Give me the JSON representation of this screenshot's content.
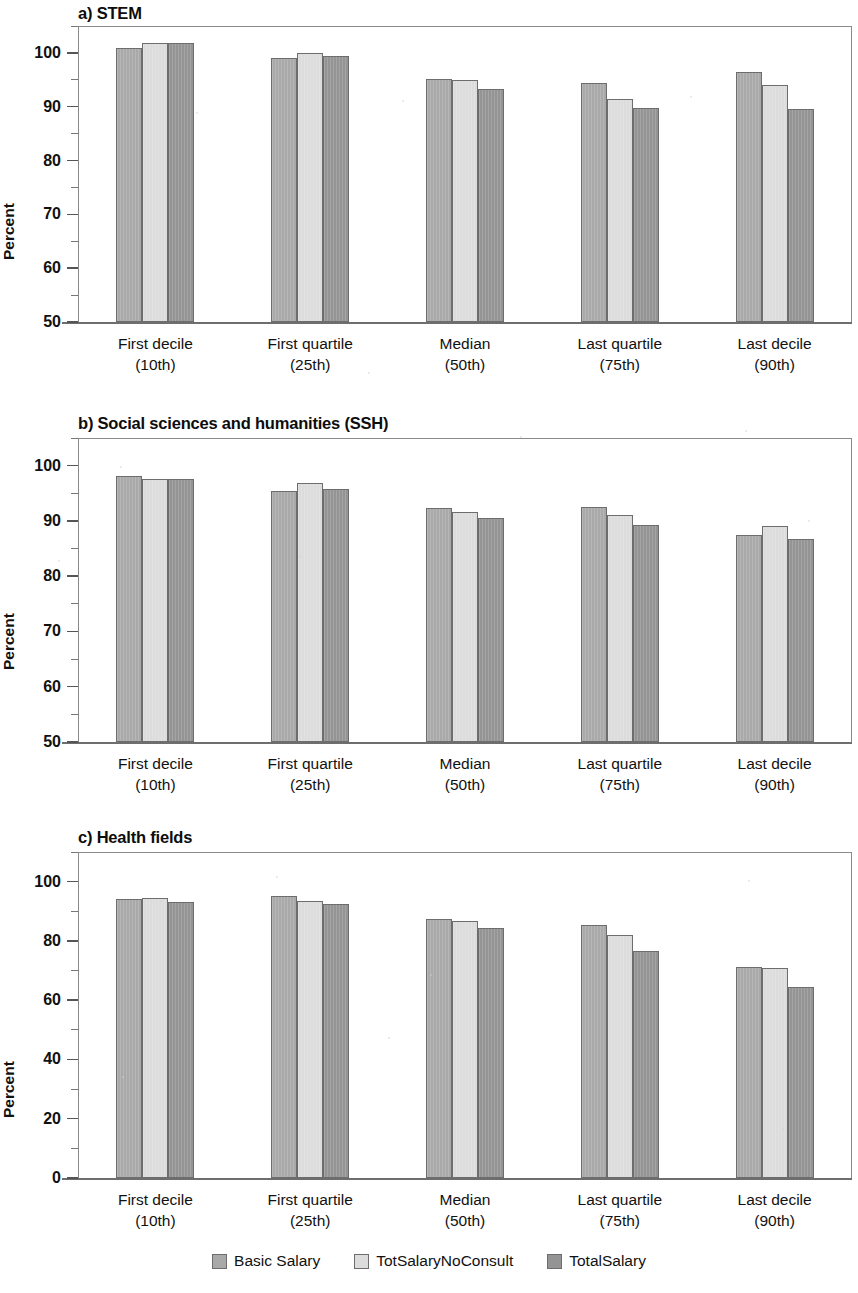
{
  "figure": {
    "ylabel": "Percent",
    "legend_position": "bottom-center",
    "series_colors": {
      "basic_salary": "#a9a9a9",
      "tot_salary_no_consult": "#dcdcdc",
      "total_salary": "#949494"
    }
  },
  "legend": {
    "items": [
      {
        "label": "Basic Salary",
        "color": "#a9a9a9"
      },
      {
        "label": "TotSalaryNoConsult",
        "color": "#dcdcdc"
      },
      {
        "label": "TotalSalary",
        "color": "#949494"
      }
    ]
  },
  "categories": [
    {
      "main": "First decile",
      "sub": "(10th)"
    },
    {
      "main": "First quartile",
      "sub": "(25th)"
    },
    {
      "main": "Median",
      "sub": "(50th)"
    },
    {
      "main": "Last quartile",
      "sub": "(75th)"
    },
    {
      "main": "Last decile",
      "sub": "(90th)"
    }
  ],
  "chart_data": [
    {
      "type": "bar",
      "panel": "a",
      "title": "a) STEM",
      "xlabel": "",
      "ylabel": "Percent",
      "ylim": [
        50,
        105
      ],
      "yticks": [
        50,
        60,
        70,
        80,
        90,
        100
      ],
      "ytick_labels": [
        "50",
        "60",
        "70",
        "80",
        "90",
        "100"
      ],
      "minor_ticks": [
        55,
        65,
        75,
        85,
        95,
        105
      ],
      "grid": false,
      "legend": "bottom",
      "categories": [
        "First decile (10th)",
        "First quartile (25th)",
        "Median (50th)",
        "Last quartile (75th)",
        "Last decile (90th)"
      ],
      "series": [
        {
          "name": "Basic Salary",
          "values": [
            101.0,
            99.1,
            95.1,
            94.4,
            96.5
          ]
        },
        {
          "name": "TotSalaryNoConsult",
          "values": [
            101.8,
            99.9,
            94.9,
            91.5,
            94.0
          ]
        },
        {
          "name": "TotalSalary",
          "values": [
            101.8,
            99.5,
            93.3,
            89.7,
            89.6
          ]
        }
      ]
    },
    {
      "type": "bar",
      "panel": "b",
      "title": "b) Social sciences and humanities (SSH)",
      "xlabel": "",
      "ylabel": "Percent",
      "ylim": [
        50,
        105
      ],
      "yticks": [
        50,
        60,
        70,
        80,
        90,
        100
      ],
      "ytick_labels": [
        "50",
        "60",
        "70",
        "80",
        "90",
        "100"
      ],
      "minor_ticks": [
        55,
        65,
        75,
        85,
        95,
        105
      ],
      "grid": false,
      "legend": "bottom",
      "categories": [
        "First decile (10th)",
        "First quartile (25th)",
        "Median (50th)",
        "Last quartile (75th)",
        "Last decile (90th)"
      ],
      "series": [
        {
          "name": "Basic Salary",
          "values": [
            98.2,
            95.5,
            92.4,
            92.6,
            87.5
          ]
        },
        {
          "name": "TotSalaryNoConsult",
          "values": [
            97.6,
            96.8,
            91.6,
            91.0,
            89.1
          ]
        },
        {
          "name": "TotalSalary",
          "values": [
            97.6,
            95.7,
            90.5,
            89.2,
            86.7
          ]
        }
      ]
    },
    {
      "type": "bar",
      "panel": "c",
      "title": "c) Health fields",
      "xlabel": "",
      "ylabel": "Percent",
      "ylim": [
        0,
        110
      ],
      "yticks": [
        0,
        20,
        40,
        60,
        80,
        100
      ],
      "ytick_labels": [
        "0",
        "20",
        "40",
        "60",
        "80",
        "100"
      ],
      "minor_ticks": [
        10,
        30,
        50,
        70,
        90,
        110
      ],
      "grid": false,
      "legend": "bottom",
      "categories": [
        "First decile (10th)",
        "First quartile (25th)",
        "Median (50th)",
        "Last quartile (75th)",
        "Last decile (90th)"
      ],
      "series": [
        {
          "name": "Basic Salary",
          "values": [
            94.0,
            95.0,
            87.5,
            85.3,
            71.2
          ]
        },
        {
          "name": "TotSalaryNoConsult",
          "values": [
            94.6,
            93.6,
            86.6,
            81.9,
            70.8
          ]
        },
        {
          "name": "TotalSalary",
          "values": [
            93.0,
            92.4,
            84.4,
            76.5,
            64.6
          ]
        }
      ]
    }
  ]
}
